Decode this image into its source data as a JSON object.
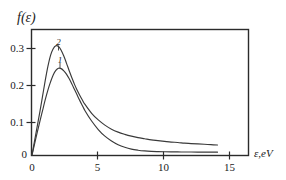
{
  "figure": {
    "background_color": "#ffffff",
    "frame_color": "#2b2b2b",
    "curve_color": "#3a3a3a"
  },
  "labels": {
    "y_axis": "f(ε)",
    "x_axis": "ε,eV",
    "curve_1": "1",
    "curve_2": "2"
  },
  "chart_data": {
    "type": "line",
    "title": "",
    "subtitle": "",
    "xlabel": "ε,eV",
    "ylabel": "f(ε)",
    "xlim": [
      0,
      16.3
    ],
    "ylim": [
      0,
      0.34
    ],
    "xticks": [
      0,
      5,
      10,
      15
    ],
    "xticklabels": [
      "0",
      "5",
      "10",
      "15"
    ],
    "yticks": [
      0,
      0.1,
      0.2,
      0.3
    ],
    "yticklabels": [
      "0",
      "0.1",
      "0.2",
      "0.3"
    ],
    "grid": false,
    "legend": "inline-curve-labels",
    "annotations": [
      {
        "text": "2",
        "x": 1.9,
        "y": 0.318
      },
      {
        "text": "1",
        "x": 2.1,
        "y": 0.253
      }
    ],
    "series": [
      {
        "name": "1",
        "label": "1",
        "x": [
          0,
          0.2,
          0.4,
          0.6,
          0.8,
          1.0,
          1.2,
          1.4,
          1.6,
          1.8,
          2.0,
          2.2,
          2.4,
          2.6,
          2.8,
          3.0,
          3.2,
          3.4,
          3.6,
          3.8,
          4.0,
          4.5,
          5.0,
          5.5,
          6.0,
          6.5,
          7.0,
          7.5,
          8.0,
          8.5,
          9.0,
          9.5,
          10.0,
          10.5,
          11.0,
          11.5,
          12.0,
          12.5,
          13.0,
          13.5,
          14.0
        ],
        "y": [
          0.0,
          0.031,
          0.062,
          0.092,
          0.121,
          0.15,
          0.176,
          0.198,
          0.217,
          0.229,
          0.235,
          0.234,
          0.228,
          0.219,
          0.207,
          0.193,
          0.178,
          0.163,
          0.148,
          0.134,
          0.12,
          0.092,
          0.069,
          0.051,
          0.038,
          0.028,
          0.021,
          0.016,
          0.013,
          0.011,
          0.0098,
          0.0092,
          0.0088,
          0.0085,
          0.0083,
          0.0082,
          0.0081,
          0.008,
          0.0079,
          0.0078,
          0.0077
        ]
      },
      {
        "name": "2",
        "label": "2",
        "x": [
          0,
          0.2,
          0.4,
          0.6,
          0.8,
          1.0,
          1.2,
          1.4,
          1.6,
          1.8,
          2.0,
          2.2,
          2.4,
          2.6,
          2.8,
          3.0,
          3.2,
          3.4,
          3.6,
          3.8,
          4.0,
          4.5,
          5.0,
          5.5,
          6.0,
          6.5,
          7.0,
          7.5,
          8.0,
          8.5,
          9.0,
          9.5,
          10.0,
          10.5,
          11.0,
          11.5,
          12.0,
          12.5,
          13.0,
          13.5,
          14.0
        ],
        "y": [
          0.0,
          0.04,
          0.079,
          0.118,
          0.16,
          0.202,
          0.24,
          0.27,
          0.288,
          0.296,
          0.294,
          0.284,
          0.268,
          0.249,
          0.229,
          0.21,
          0.192,
          0.176,
          0.162,
          0.149,
          0.137,
          0.113,
          0.095,
          0.081,
          0.07,
          0.062,
          0.056,
          0.051,
          0.047,
          0.044,
          0.041,
          0.039,
          0.037,
          0.035,
          0.034,
          0.032,
          0.031,
          0.03,
          0.029,
          0.028,
          0.027
        ]
      }
    ]
  }
}
